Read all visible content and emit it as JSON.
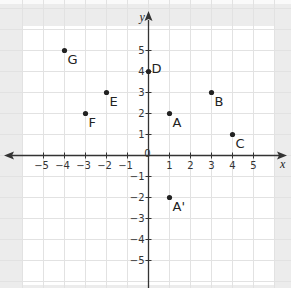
{
  "chart_data": {
    "type": "scatter",
    "title": "",
    "xlabel": "x",
    "ylabel": "y",
    "xlim": [
      -6,
      6
    ],
    "ylim": [
      -6,
      6
    ],
    "grid": true,
    "x_ticks": [
      -5,
      -4,
      -3,
      -2,
      -1,
      1,
      2,
      3,
      4,
      5
    ],
    "y_ticks": [
      -5,
      -4,
      -3,
      -2,
      -1,
      1,
      2,
      3,
      4,
      5
    ],
    "origin_label": "0",
    "points": [
      {
        "label": "A",
        "x": 1,
        "y": 2
      },
      {
        "label": "B",
        "x": 3,
        "y": 3
      },
      {
        "label": "C",
        "x": 4,
        "y": 1
      },
      {
        "label": "D",
        "x": 0,
        "y": 4
      },
      {
        "label": "E",
        "x": -2,
        "y": 3
      },
      {
        "label": "F",
        "x": -3,
        "y": 2
      },
      {
        "label": "G",
        "x": -4,
        "y": 5
      },
      {
        "label": "A'",
        "x": 1,
        "y": -2
      }
    ]
  },
  "colors": {
    "background": "#ececec",
    "grid_bg": "#ffffff",
    "grid_line": "#e2e2e2",
    "axis": "#333333",
    "point": "#222222"
  }
}
